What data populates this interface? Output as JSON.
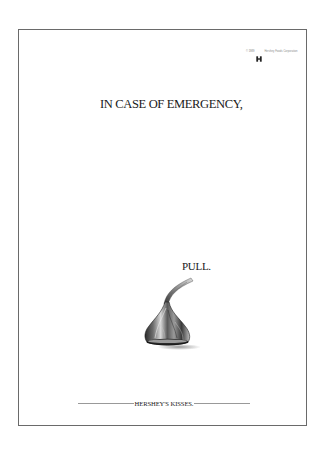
{
  "ad": {
    "headline": "IN CASE OF EMERGENCY,",
    "call_to_action": "PULL.",
    "brand_signature": "HERSHEY'S KISSES.",
    "copyright": {
      "left_text": "© 1989",
      "logo_icon": "hershey-h-logo-icon",
      "right_text": "Hershey Foods Corporation"
    },
    "product_image": "hersheys-kiss-with-plume-icon"
  },
  "colors": {
    "background": "#ffffff",
    "frame_border": "#6a6a6a",
    "text": "#1a1a1a",
    "rule": "#999999"
  }
}
